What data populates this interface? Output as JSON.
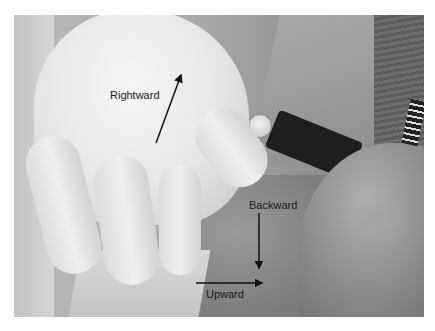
{
  "image": {
    "description": "Grayscale clinical photograph of a gloved hand palpating a patient's neck below the jaw, with directional arrows",
    "background_color": "#ffffff"
  },
  "annotations": [
    {
      "id": "rightward",
      "label": "Rightward",
      "arrow_direction": "up-right"
    },
    {
      "id": "backward",
      "label": "Backward",
      "arrow_direction": "down"
    },
    {
      "id": "upward",
      "label": "Upward",
      "arrow_direction": "right"
    }
  ]
}
